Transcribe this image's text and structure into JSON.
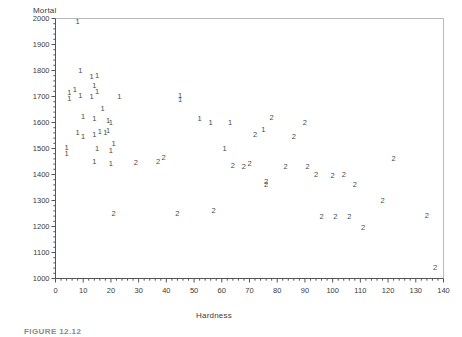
{
  "figure": {
    "caption": "FIGURE 12.12"
  },
  "chart_data": {
    "type": "scatter",
    "title": "",
    "xlabel": "Hardness",
    "ylabel": "Mortal",
    "xlim": [
      0,
      140
    ],
    "ylim": [
      1000,
      2000
    ],
    "x_major_step": 10,
    "x_minor_step": 2,
    "y_major_step": 100,
    "y_minor_step": 20,
    "grid": false,
    "legend": "none",
    "marker_style": "group-digit",
    "xticks": [
      "0",
      "10",
      "20",
      "30",
      "40",
      "50",
      "60",
      "70",
      "80",
      "90",
      "100",
      "110",
      "120",
      "130",
      "140"
    ],
    "yticks": [
      "1000",
      "1100",
      "1200",
      "1300",
      "1400",
      "1500",
      "1600",
      "1700",
      "1800",
      "1900",
      "2000"
    ],
    "series": [
      {
        "name": "1",
        "label": "1",
        "color": "#4a4a4a",
        "points": [
          [
            8,
            1987
          ],
          [
            9,
            1800
          ],
          [
            13,
            1775
          ],
          [
            15,
            1778
          ],
          [
            14,
            1742
          ],
          [
            15,
            1718
          ],
          [
            5,
            1712
          ],
          [
            5,
            1690
          ],
          [
            7,
            1724
          ],
          [
            9,
            1703
          ],
          [
            13,
            1700
          ],
          [
            23,
            1700
          ],
          [
            45,
            1703
          ],
          [
            45,
            1688
          ],
          [
            17,
            1652
          ],
          [
            10,
            1623
          ],
          [
            14,
            1614
          ],
          [
            19,
            1607
          ],
          [
            20,
            1600
          ],
          [
            52,
            1612
          ],
          [
            56,
            1598
          ],
          [
            63,
            1598
          ],
          [
            8,
            1560
          ],
          [
            10,
            1546
          ],
          [
            14,
            1552
          ],
          [
            16,
            1562
          ],
          [
            18,
            1558
          ],
          [
            19,
            1568
          ],
          [
            75,
            1570
          ],
          [
            4,
            1502
          ],
          [
            4,
            1480
          ],
          [
            15,
            1498
          ],
          [
            20,
            1492
          ],
          [
            21,
            1516
          ],
          [
            61,
            1500
          ],
          [
            14,
            1448
          ],
          [
            20,
            1442
          ]
        ]
      },
      {
        "name": "2",
        "label": "2",
        "color": "#4a4a4a",
        "points": [
          [
            78,
            1618
          ],
          [
            90,
            1600
          ],
          [
            72,
            1552
          ],
          [
            86,
            1545
          ],
          [
            29,
            1443
          ],
          [
            37,
            1450
          ],
          [
            39,
            1462
          ],
          [
            64,
            1432
          ],
          [
            68,
            1430
          ],
          [
            70,
            1442
          ],
          [
            83,
            1430
          ],
          [
            91,
            1430
          ],
          [
            122,
            1458
          ],
          [
            94,
            1400
          ],
          [
            100,
            1395
          ],
          [
            104,
            1398
          ],
          [
            108,
            1360
          ],
          [
            76,
            1370
          ],
          [
            76,
            1358
          ],
          [
            118,
            1298
          ],
          [
            21,
            1250
          ],
          [
            44,
            1250
          ],
          [
            57,
            1258
          ],
          [
            96,
            1238
          ],
          [
            101,
            1238
          ],
          [
            106,
            1238
          ],
          [
            111,
            1195
          ],
          [
            134,
            1240
          ],
          [
            137,
            1040
          ]
        ]
      }
    ]
  }
}
